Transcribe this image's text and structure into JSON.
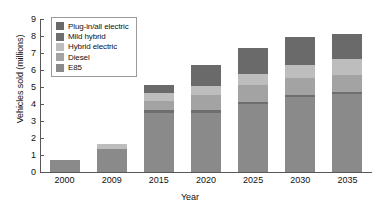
{
  "chart_data": {
    "type": "bar",
    "stacked": true,
    "title": "",
    "xlabel": "Year",
    "ylabel": "Vehicles sold (millions)",
    "categories": [
      "2000",
      "2009",
      "2015",
      "2020",
      "2025",
      "2030",
      "2035"
    ],
    "ylim": [
      0,
      9
    ],
    "yticks": [
      0,
      1,
      2,
      3,
      4,
      5,
      6,
      7,
      8,
      9
    ],
    "grid": false,
    "legend_position": "top-left",
    "series": [
      {
        "name": "E85",
        "color": "#8a8a8a",
        "values": [
          0.7,
          1.35,
          3.5,
          3.5,
          4.0,
          4.4,
          4.6
        ]
      },
      {
        "name": "Diesel",
        "color": "#6e6e6e",
        "values": [
          0.0,
          0.0,
          0.12,
          0.12,
          0.12,
          0.12,
          0.12
        ]
      },
      {
        "name": "Hybrid electric",
        "color": "#a3a3a3",
        "values": [
          0.0,
          0.0,
          0.55,
          0.9,
          1.0,
          1.0,
          1.0
        ]
      },
      {
        "name": "Mild hybrid",
        "color": "#bdbdbd",
        "values": [
          0.0,
          0.3,
          0.45,
          0.55,
          0.65,
          0.75,
          0.95
        ]
      },
      {
        "name": "Plug-in/all electric",
        "color": "#6a6a6a",
        "values": [
          0.0,
          0.0,
          0.5,
          1.2,
          1.55,
          1.65,
          1.45
        ]
      }
    ],
    "totals": [
      0.7,
      1.65,
      5.12,
      6.27,
      7.32,
      7.92,
      8.12
    ]
  },
  "legend": {
    "items": [
      {
        "label": "Plug-in/all electric",
        "color": "#6a6a6a"
      },
      {
        "label": "Mild hybrid",
        "color": "#6e6e6e"
      },
      {
        "label": "Hybrid electric",
        "color": "#bdbdbd"
      },
      {
        "label": "Diesel",
        "color": "#a3a3a3"
      },
      {
        "label": "E85",
        "color": "#8a8a8a"
      }
    ]
  },
  "colors": {
    "axis": "#58585a",
    "text": "#111111",
    "background": "#ffffff",
    "legend_border": "#9a9a9a"
  }
}
